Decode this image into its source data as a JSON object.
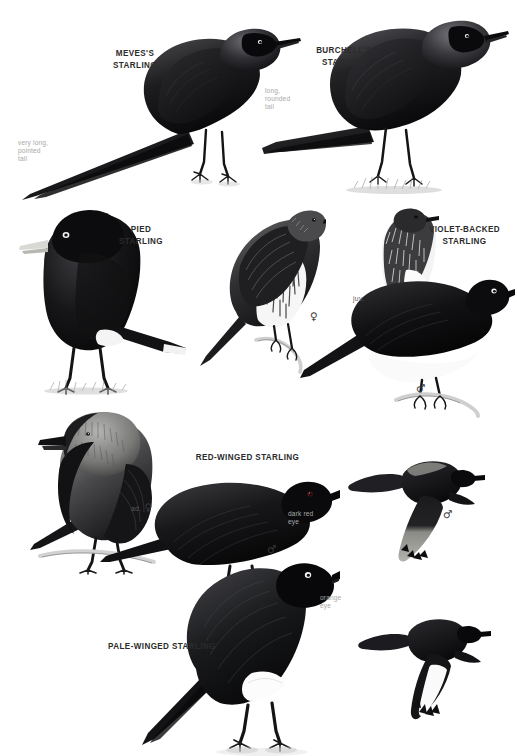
{
  "plate": {
    "width": 517,
    "height": 756,
    "background": "#ffffff",
    "subject": "starlings",
    "ink_color": "#111111",
    "label_color": "#2b2b2b",
    "annotation_color": "#a9a9a9"
  },
  "species": [
    {
      "id": "meves",
      "label": "MEVES'S\nSTARLING",
      "x": 83,
      "y": 48,
      "width": 104
    },
    {
      "id": "burchell",
      "label": "BURCHELL'S\nSTARLING",
      "x": 290,
      "y": 45,
      "width": 108
    },
    {
      "id": "pied",
      "label": "PIED\nSTARLING",
      "x": 94,
      "y": 224,
      "width": 94
    },
    {
      "id": "violet-backed",
      "label": "VIOLET-BACKED\nSTARLING",
      "x": 412,
      "y": 224,
      "width": 105
    },
    {
      "id": "red-winged",
      "label": "RED-WINGED STARLING",
      "x": 180,
      "y": 452,
      "width": 135
    },
    {
      "id": "pale-winged",
      "label": "PALE-WINGED STARLING",
      "x": 92,
      "y": 641,
      "width": 140
    }
  ],
  "annotations": [
    {
      "id": "meves-tail",
      "text": "very long,\npointed\ntail",
      "x": 18,
      "y": 139
    },
    {
      "id": "burchell-tail",
      "text": "long,\nrounded\ntail",
      "x": 265,
      "y": 87
    },
    {
      "id": "red-winged-eye",
      "text": "dark red\neye",
      "x": 288,
      "y": 510
    },
    {
      "id": "pale-winged-eye",
      "text": "orange\neye",
      "x": 320,
      "y": 594
    }
  ],
  "symbols": [
    {
      "id": "violet-backed-female",
      "age": "",
      "glyph": "♀",
      "x": 310,
      "y": 310
    },
    {
      "id": "violet-backed-juvenile",
      "age": "juv.",
      "glyph": "",
      "x": 353,
      "y": 291
    },
    {
      "id": "violet-backed-male",
      "age": "",
      "glyph": "♂",
      "x": 416,
      "y": 382
    },
    {
      "id": "red-winged-adult-female",
      "age": "ad.",
      "glyph": "♀",
      "x": 131,
      "y": 501
    },
    {
      "id": "red-winged-male",
      "age": "",
      "glyph": "♂",
      "x": 267,
      "y": 543
    },
    {
      "id": "red-winged-flight-male",
      "age": "",
      "glyph": "♂",
      "x": 443,
      "y": 508
    }
  ]
}
